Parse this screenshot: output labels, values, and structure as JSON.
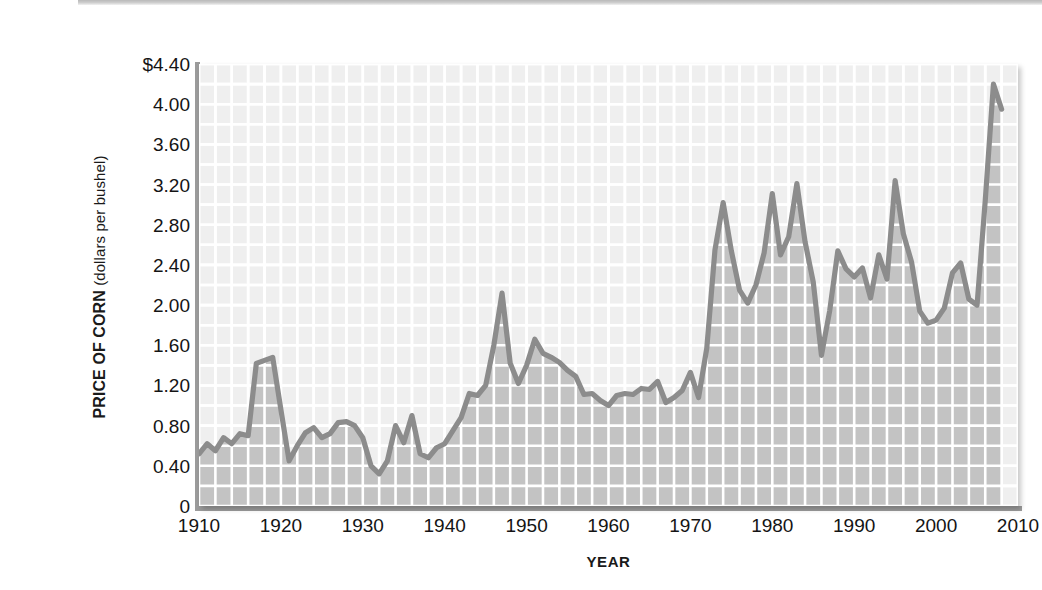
{
  "chart_data": {
    "type": "area",
    "title": "",
    "xlabel": "YEAR",
    "ylabel": "PRICE OF CORN (dollars per bushel)",
    "ylabel_strong": "PRICE OF CORN",
    "ylabel_light": "(dollars per bushel)",
    "xlim": [
      1910,
      2010
    ],
    "ylim": [
      0,
      4.4
    ],
    "grid": true,
    "grid_color": "#ffffff",
    "legend": "none",
    "series_name": "Price of corn",
    "line_color": "#8c8c8c",
    "fill_color": "#c3c3c3",
    "plot_bg_color": "#efefef",
    "y_ticks": [
      "$4.40",
      "4.00",
      "3.60",
      "3.20",
      "2.80",
      "2.40",
      "2.00",
      "1.60",
      "1.20",
      "0.80",
      "0.40",
      "0"
    ],
    "y_tick_values": [
      4.4,
      4.0,
      3.6,
      3.2,
      2.8,
      2.4,
      2.0,
      1.6,
      1.2,
      0.8,
      0.4,
      0
    ],
    "x_ticks": [
      "1910",
      "1920",
      "1930",
      "1940",
      "1950",
      "1960",
      "1970",
      "1980",
      "1990",
      "2000",
      "2010"
    ],
    "x_tick_values": [
      1910,
      1920,
      1930,
      1940,
      1950,
      1960,
      1970,
      1980,
      1990,
      2000,
      2010
    ],
    "x": [
      1910,
      1911,
      1912,
      1913,
      1914,
      1915,
      1916,
      1917,
      1918,
      1919,
      1920,
      1921,
      1922,
      1923,
      1924,
      1925,
      1926,
      1927,
      1928,
      1929,
      1930,
      1931,
      1932,
      1933,
      1934,
      1935,
      1936,
      1937,
      1938,
      1939,
      1940,
      1941,
      1942,
      1943,
      1944,
      1945,
      1946,
      1947,
      1948,
      1949,
      1950,
      1951,
      1952,
      1953,
      1954,
      1955,
      1956,
      1957,
      1958,
      1959,
      1960,
      1961,
      1962,
      1963,
      1964,
      1965,
      1966,
      1967,
      1968,
      1969,
      1970,
      1971,
      1972,
      1973,
      1974,
      1975,
      1976,
      1977,
      1978,
      1979,
      1980,
      1981,
      1982,
      1983,
      1984,
      1985,
      1986,
      1987,
      1988,
      1989,
      1990,
      1991,
      1992,
      1993,
      1994,
      1995,
      1996,
      1997,
      1998,
      1999,
      2000,
      2001,
      2002,
      2003,
      2004,
      2005,
      2006,
      2007,
      2008
    ],
    "values": [
      0.52,
      0.62,
      0.55,
      0.68,
      0.62,
      0.72,
      0.7,
      1.42,
      1.45,
      1.48,
      0.96,
      0.45,
      0.6,
      0.73,
      0.78,
      0.68,
      0.72,
      0.83,
      0.84,
      0.8,
      0.68,
      0.4,
      0.32,
      0.45,
      0.8,
      0.63,
      0.9,
      0.52,
      0.48,
      0.58,
      0.62,
      0.75,
      0.88,
      1.12,
      1.1,
      1.2,
      1.6,
      2.12,
      1.42,
      1.22,
      1.4,
      1.66,
      1.52,
      1.48,
      1.43,
      1.35,
      1.29,
      1.11,
      1.12,
      1.05,
      1.0,
      1.1,
      1.12,
      1.11,
      1.17,
      1.16,
      1.24,
      1.03,
      1.08,
      1.15,
      1.33,
      1.08,
      1.57,
      2.55,
      3.02,
      2.54,
      2.15,
      2.02,
      2.2,
      2.52,
      3.11,
      2.5,
      2.68,
      3.21,
      2.63,
      2.23,
      1.5,
      1.94,
      2.54,
      2.36,
      2.28,
      2.37,
      2.07,
      2.5,
      2.26,
      3.24,
      2.71,
      2.43,
      1.94,
      1.82,
      1.85,
      1.97,
      2.32,
      2.42,
      2.06,
      2.0,
      3.04,
      4.2,
      3.95
    ],
    "line_segments_note": "continuous single series, area filled to y=0"
  },
  "axes": {
    "y_label_strong": "PRICE OF CORN",
    "y_label_light": " (dollars per bushel)",
    "x_label": "YEAR"
  }
}
